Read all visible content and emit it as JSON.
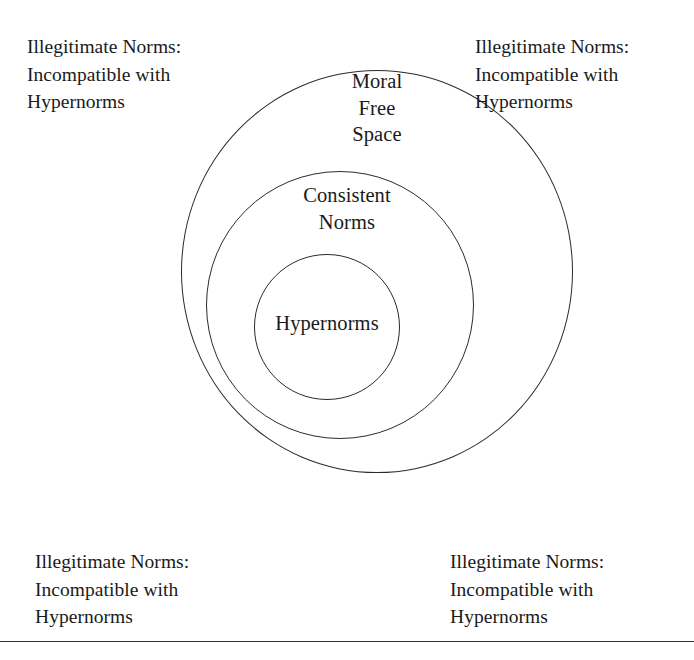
{
  "figure": {
    "background_color": "#ffffff",
    "line_color": "#2b2b2b",
    "text_color": "#1a1a1a"
  },
  "rings": {
    "outer": {
      "name": "Moral Free Space",
      "label_lines": [
        "Moral",
        "Free",
        "Space"
      ]
    },
    "middle": {
      "name": "Consistent Norms",
      "label_lines": [
        "Consistent",
        "Norms"
      ]
    },
    "inner": {
      "name": "Hypernorms",
      "label_lines": [
        "Hypernorms"
      ]
    }
  },
  "corner_captions": {
    "top_left": {
      "lines": [
        "Illegitimate Norms:",
        "Incompatible with",
        "Hypernorms"
      ]
    },
    "top_right": {
      "lines": [
        "Illegitimate Norms:",
        "Incompatible with",
        "Hypernorms"
      ]
    },
    "bottom_left": {
      "lines": [
        "Illegitimate Norms:",
        "Incompatible with",
        "Hypernorms"
      ]
    },
    "bottom_right": {
      "lines": [
        "Illegitimate Norms:",
        "Incompatible with",
        "Hypernorms"
      ]
    }
  }
}
